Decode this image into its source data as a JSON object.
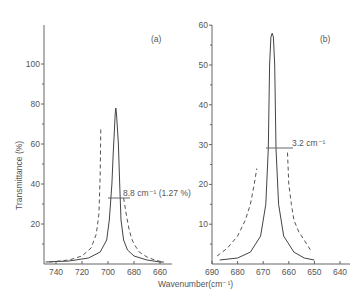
{
  "chart_data": [
    {
      "type": "line",
      "panel_label": "(a)",
      "xlabel": "Wavenumber(cm⁻¹)",
      "ylabel": "Transmittance (%)",
      "x_ticks": [
        740,
        720,
        700,
        680,
        660
      ],
      "y_ticks": [
        20,
        40,
        60,
        80,
        100
      ],
      "xlim": [
        750,
        655
      ],
      "ylim": [
        0,
        120
      ],
      "annotation": "8.8 cm⁻¹ (1.27 %)",
      "series": [
        {
          "name": "solid",
          "style": "solid",
          "x": [
            748,
            730,
            715,
            706,
            701,
            699,
            697,
            696,
            695,
            694.5,
            694,
            693.5,
            692,
            691,
            690,
            688,
            685,
            680,
            670,
            660,
            657
          ],
          "y": [
            1,
            1.5,
            3,
            6,
            12,
            22,
            40,
            55,
            68,
            75,
            78,
            75,
            60,
            40,
            22,
            12,
            7,
            4,
            2,
            1,
            1
          ]
        },
        {
          "name": "dashed",
          "style": "dashed",
          "x": [
            745,
            730,
            720,
            713,
            709,
            707,
            706,
            705.5
          ],
          "y": [
            1,
            2,
            4,
            8,
            15,
            25,
            45,
            68
          ]
        },
        {
          "name": "dashed-right",
          "style": "dashed",
          "x": [
            688,
            686,
            684,
            682,
            680,
            676,
            670,
            664,
            658
          ],
          "y": [
            33,
            25,
            18,
            13,
            10,
            6,
            3.5,
            2,
            1
          ]
        }
      ]
    },
    {
      "type": "line",
      "panel_label": "(b)",
      "xlabel": "Wavenumber(cm⁻¹)",
      "ylabel": "Transmittance (%)",
      "x_ticks": [
        690,
        680,
        670,
        660,
        650,
        640
      ],
      "y_ticks": [
        10,
        20,
        30,
        40,
        50,
        60
      ],
      "xlim": [
        690,
        636
      ],
      "ylim": [
        0,
        60
      ],
      "annotation": "3.2 cm⁻¹",
      "series": [
        {
          "name": "solid",
          "style": "solid",
          "x": [
            687,
            680,
            675,
            671,
            669,
            668,
            667.5,
            667,
            666.5,
            666,
            665.5,
            665,
            664,
            662,
            658,
            654,
            650
          ],
          "y": [
            1,
            1.5,
            3,
            7,
            15,
            29,
            50,
            57,
            58,
            57,
            50,
            29,
            15,
            7,
            3,
            1.5,
            1
          ]
        },
        {
          "name": "dashed-left",
          "style": "dashed",
          "x": [
            688,
            684,
            680,
            677,
            675,
            673.5,
            672.5
          ],
          "y": [
            2,
            4,
            7,
            11,
            15,
            20,
            24
          ]
        },
        {
          "name": "dashed-right",
          "style": "dashed",
          "x": [
            660.5,
            660,
            659,
            658,
            656,
            654,
            651
          ],
          "y": [
            28,
            20,
            15,
            11,
            8,
            6,
            3
          ]
        }
      ]
    }
  ],
  "labels": {
    "panel_a": "(a)",
    "panel_b": "(b)",
    "ylabel": "Transmittance (%)",
    "xlabel": "Wavenumber(cm⁻¹)",
    "annotation_a": "8.8 cm⁻¹ (1.27 %)",
    "annotation_b": "3.2 cm⁻¹"
  }
}
